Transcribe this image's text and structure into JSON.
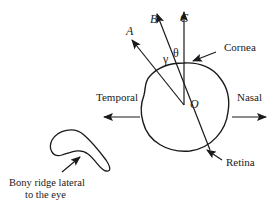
{
  "diagram": {
    "type": "eye-axes-schematic",
    "axes": [
      {
        "id": "A",
        "label": "A"
      },
      {
        "id": "B",
        "label": "B"
      },
      {
        "id": "C",
        "label": "C"
      }
    ],
    "angles": {
      "gamma": "γ",
      "theta": "θ"
    },
    "center_label": "O",
    "structures": {
      "cornea": "Cornea",
      "retina": "Retina",
      "temporal": "Temporal",
      "nasal": "Nasal",
      "bony_ridge_line1": "Bony ridge lateral",
      "bony_ridge_line2": "to the eye"
    },
    "colors": {
      "stroke": "#1a1a1a",
      "background": "#ffffff"
    }
  }
}
